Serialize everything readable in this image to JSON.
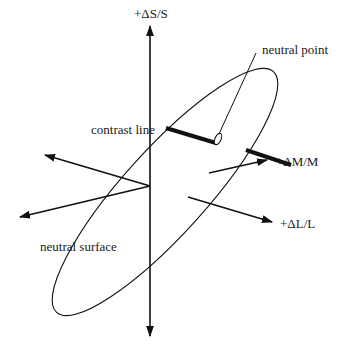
{
  "diagram": {
    "labels": {
      "s_axis": "+ΔS/S",
      "m_axis": "+ΔM/M",
      "l_axis": "+ΔL/L",
      "neutral_point": "neutral point",
      "contrast_line": "contrast line",
      "neutral_surface": "neutral surface"
    },
    "colors": {
      "stroke": "#111111",
      "background": "#ffffff"
    }
  }
}
